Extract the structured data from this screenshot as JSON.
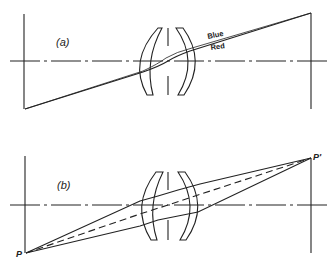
{
  "figure": {
    "panel_a": {
      "label": "(a)",
      "ray_labels": {
        "blue": "Blue",
        "red": "Red"
      }
    },
    "panel_b": {
      "label": "(b)",
      "object_point": "P",
      "image_point": "P'"
    }
  }
}
